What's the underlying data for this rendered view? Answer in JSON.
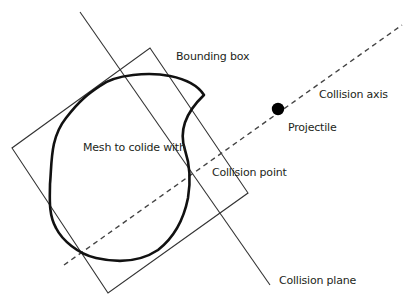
{
  "diagram": {
    "labels": {
      "bounding_box": "Bounding box",
      "collision_axis": "Collision axis",
      "projectile": "Projectile",
      "mesh": "Mesh to colide with",
      "collision_point": "Collision point",
      "collision_plane": "Collision plane"
    },
    "colors": {
      "stroke": "#333333",
      "mesh": "#111111",
      "text": "#231f20",
      "background": "#ffffff"
    }
  }
}
